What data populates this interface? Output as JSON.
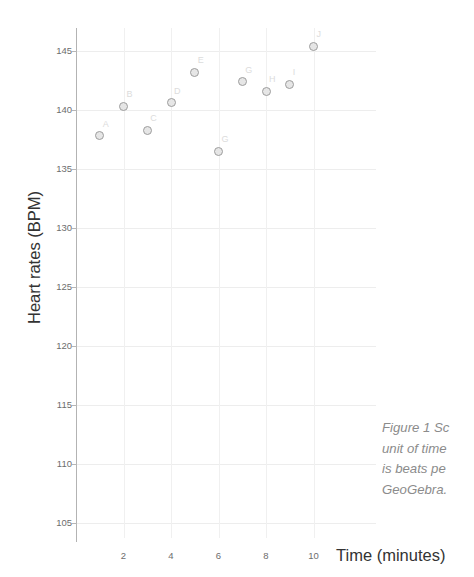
{
  "top_clipped_text": {
    "left_fragment": "",
    "right_fragment": ""
  },
  "axes": {
    "y_title": "Heart rates (BPM)",
    "x_title": "Time (minutes)"
  },
  "caption": {
    "line1": "Figure 1 Sc",
    "line2": "unit of time",
    "line3": "is beats pe",
    "line4": "GeoGebra."
  },
  "chart_data": {
    "type": "scatter",
    "title": "",
    "xlabel": "Time (minutes)",
    "ylabel": "Heart rates (BPM)",
    "xlim": [
      0,
      11
    ],
    "ylim": [
      103,
      147
    ],
    "xticks": [
      2,
      4,
      6,
      8,
      10
    ],
    "yticks": [
      105,
      110,
      115,
      120,
      125,
      130,
      135,
      140,
      145
    ],
    "grid": true,
    "legend": "none",
    "point_labels": [
      "A",
      "B",
      "C",
      "D",
      "E",
      "F",
      "G",
      "H",
      "I",
      "J"
    ],
    "x": [
      1,
      2,
      3,
      4,
      5,
      6,
      7,
      8,
      9,
      10
    ],
    "y": [
      137.8,
      140.3,
      138.3,
      140.6,
      143.2,
      136.5,
      142.4,
      141.6,
      142.2,
      145.4
    ],
    "points": [
      {
        "label": "A",
        "x": 1,
        "y": 137.8
      },
      {
        "label": "B",
        "x": 2,
        "y": 140.3
      },
      {
        "label": "C",
        "x": 3,
        "y": 138.3
      },
      {
        "label": "D",
        "x": 4,
        "y": 140.6
      },
      {
        "label": "E",
        "x": 5,
        "y": 143.2
      },
      {
        "label": "G",
        "x": 6,
        "y": 136.5
      },
      {
        "label": "G",
        "x": 7,
        "y": 142.4
      },
      {
        "label": "H",
        "x": 8,
        "y": 141.6
      },
      {
        "label": "I",
        "x": 9,
        "y": 142.2
      },
      {
        "label": "J",
        "x": 10,
        "y": 145.4
      }
    ],
    "marker_color": "#9d9d9d",
    "marker_fill": "#e6e6e6",
    "grid_color": "#ededed",
    "axis_color": "#b3b3b3"
  }
}
